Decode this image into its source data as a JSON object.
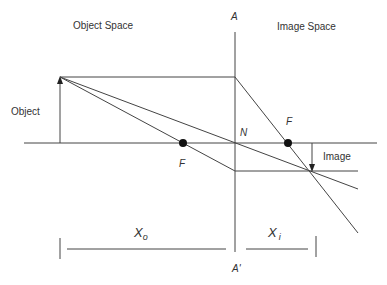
{
  "labels": {
    "object_space": "Object Space",
    "image_space": "Image Space",
    "object": "Object",
    "image": "Image",
    "axis_top": "A",
    "axis_bottom": "A'",
    "nodal_point": "N",
    "front_focal": "F",
    "back_focal": "F",
    "xo_main": "X",
    "xo_sub": "o",
    "xi_main": "X",
    "xi_sub": "i"
  },
  "colors": {
    "line": "#444444",
    "text": "#333333",
    "background": "#ffffff"
  }
}
